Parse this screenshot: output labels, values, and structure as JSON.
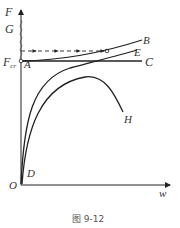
{
  "figure": {
    "caption": "图 9-12",
    "axes": {
      "y_label": "F",
      "x_label": "w",
      "origin_label": "O"
    },
    "labels": {
      "G": "G",
      "F_cr_main": "F",
      "F_cr_sub": "cr",
      "A": "A",
      "B": "B",
      "C": "C",
      "D": "D",
      "E": "E",
      "H": "H"
    },
    "colors": {
      "line": "#222222",
      "text": "#333333"
    },
    "curves": [
      {
        "name": "A-C",
        "description": "horizontal line at critical load F_cr"
      },
      {
        "name": "A-B",
        "description": "rising post-buckling curve from A to B"
      },
      {
        "name": "D-E",
        "description": "imperfect curve approaching E asymptotically"
      },
      {
        "name": "D-H",
        "description": "curve rising to maximum then descending to H"
      },
      {
        "name": "G-dashed",
        "description": "dashed arrowed path from F axis to curve A-B (snap)"
      }
    ]
  }
}
